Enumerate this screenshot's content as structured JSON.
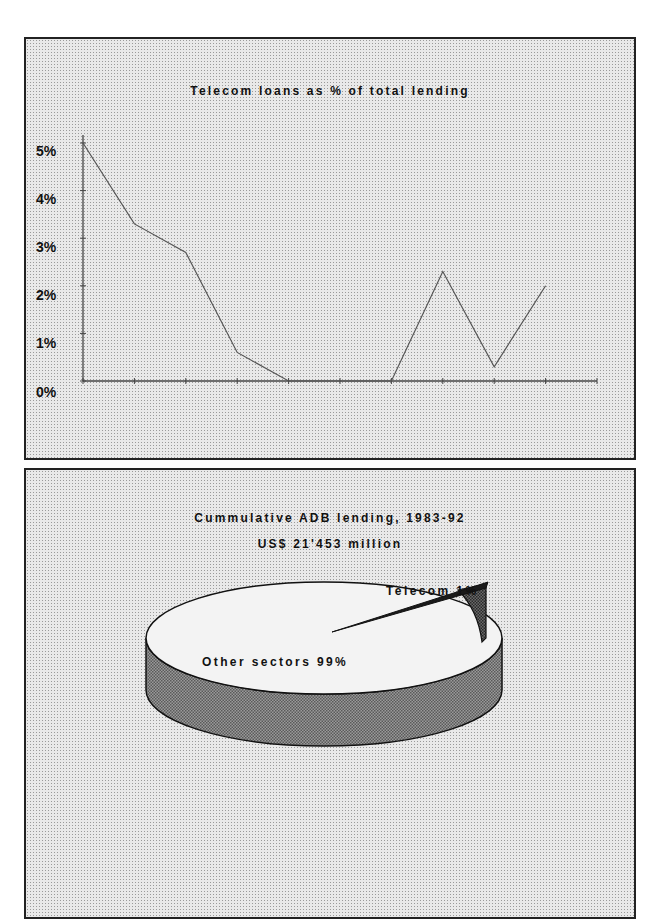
{
  "page_header": {
    "visible_text": ""
  },
  "line_panel": {
    "title": "Telecom loans as % of total lending",
    "y_tick_labels": [
      "5%",
      "4%",
      "3%",
      "2%",
      "1%",
      "0%"
    ]
  },
  "pie_panel": {
    "title_line1": "Cummulative ADB lending, 1983-92",
    "title_line2": "US$ 21'453 million",
    "label_telecom": "Telecom 1%",
    "label_other": "Other sectors 99%"
  },
  "colors": {
    "panel_bg": "#e9e9e9",
    "line": "#555555",
    "pie_top": "#f2f2f2",
    "pie_side": "#8a8a8a",
    "telecom_slice": "#3a3a3a"
  },
  "chart_data": [
    {
      "type": "line",
      "title": "Telecom loans as % of total lending",
      "xlabel": "",
      "ylabel": "",
      "categories": [
        "1983",
        "1984",
        "1985",
        "1986",
        "1987",
        "1988",
        "1989",
        "1990",
        "1991",
        "1992"
      ],
      "series": [
        {
          "name": "Telecom loans as % of total lending",
          "values": [
            5.0,
            3.3,
            2.7,
            0.6,
            0.0,
            0.0,
            0.0,
            2.3,
            0.3,
            2.0
          ]
        }
      ],
      "y_tick_labels": [
        "0%",
        "1%",
        "2%",
        "3%",
        "4%",
        "5%"
      ],
      "ylim": [
        0,
        5
      ],
      "grid": false,
      "legend": "none",
      "x_tick_labels_visible": false
    },
    {
      "type": "pie",
      "title": "Cummulative ADB lending, 1983-92",
      "subtitle": "US$ 21'453 million",
      "categories": [
        "Telecom",
        "Other sectors"
      ],
      "values": [
        1,
        99
      ],
      "labels": [
        "Telecom 1%",
        "Other sectors 99%"
      ],
      "style": "3d",
      "legend": "none"
    }
  ]
}
